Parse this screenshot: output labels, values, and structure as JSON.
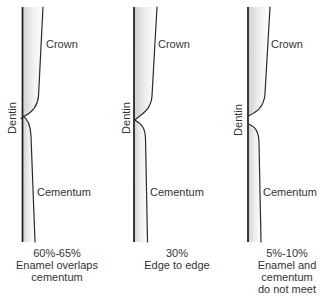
{
  "figure": {
    "colors": {
      "line": "#1a1a1a",
      "text": "#333333",
      "fill_dark": "#cfcfcf",
      "fill_light": "#ffffff"
    }
  },
  "panels": [
    {
      "relationship": "overlap",
      "crown_label": "Crown",
      "dentin_label": "Dentin",
      "cementum_label": "Cementum",
      "caption": [
        "60%-65%",
        "Enamel overlaps",
        "cementum"
      ]
    },
    {
      "relationship": "edge-to-edge",
      "crown_label": "Crown",
      "dentin_label": "Dentin",
      "cementum_label": "Cementum",
      "caption": [
        "30%",
        "Edge to edge"
      ]
    },
    {
      "relationship": "gap",
      "crown_label": "Crown",
      "dentin_label": "Dentin",
      "cementum_label": "Cementum",
      "caption": [
        "5%-10%",
        "Enamel and",
        "cementum",
        "do not meet"
      ]
    }
  ]
}
